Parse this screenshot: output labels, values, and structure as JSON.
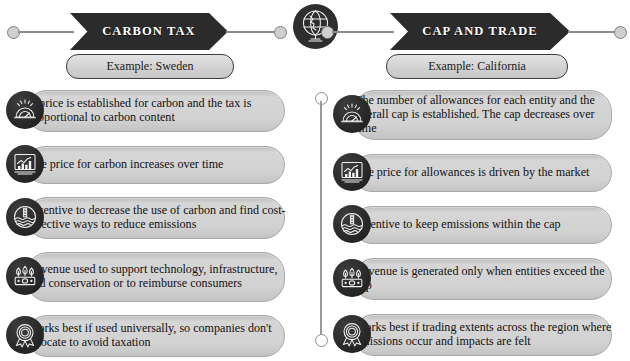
{
  "columns": [
    {
      "id": "carbon-tax",
      "banner_label": "CARBON TAX",
      "example_label": "Example: Sweden",
      "rows": [
        {
          "icon": "gauge-icon",
          "text": "A price is established for carbon and the tax is proportional to carbon content"
        },
        {
          "icon": "bar-chart-icon",
          "text": "The price for carbon increases over time"
        },
        {
          "icon": "thermometer-water-icon",
          "text": "Incentive to decrease the use of carbon and find cost-effective ways to reduce emissions"
        },
        {
          "icon": "money-plant-icon",
          "text": "Revenue used to support technology, infrastructure, and conservation or to reimburse consumers"
        },
        {
          "icon": "award-ribbon-icon",
          "text": "Works best if used universally, so companies don't relocate to avoid taxation"
        }
      ]
    },
    {
      "id": "cap-and-trade",
      "banner_label": "CAP AND TRADE",
      "example_label": "Example: California",
      "rows": [
        {
          "icon": "gauge-icon",
          "text": "The number of allowances for each entity and the overall cap is established. The cap decreases over time"
        },
        {
          "icon": "bar-chart-icon",
          "text": "The price for allowances is driven by the market"
        },
        {
          "icon": "thermometer-water-icon",
          "text": "Incentive to keep emissions within the cap"
        },
        {
          "icon": "money-plant-icon",
          "text": "Revenue is generated only when entities exceed the cap"
        },
        {
          "icon": "award-ribbon-icon",
          "text": "Works best if trading extents across the region where emissions occur and impacts are felt"
        }
      ]
    }
  ],
  "center_icon": "globe-stand-icon",
  "colors": {
    "banner_fill": "#2b2b2b",
    "banner_text": "#ffffff",
    "pill_fill": "#d2d2d2",
    "badge_fill": "#262626",
    "icon_stroke": "#f2f2f2",
    "connector": "#8c8c8c",
    "divider": "#9a9a9a"
  }
}
